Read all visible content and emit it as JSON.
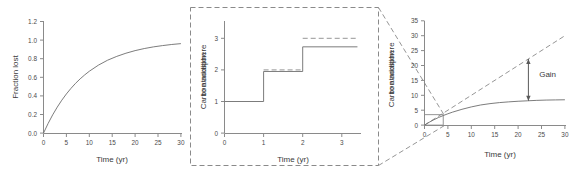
{
  "figure": {
    "panel_count": 3,
    "background": "#ffffff",
    "line_color": "#6d6d6d",
    "text_color": "#3a3a3a",
    "dashed_color": "#8a8a8a"
  },
  "chart_data": [
    {
      "id": "panel1",
      "type": "line",
      "title": "",
      "xlabel": "Time (yr)",
      "ylabel": "Fraction lost",
      "xlim": [
        0,
        31
      ],
      "ylim": [
        0,
        1.2
      ],
      "xticks": [
        0,
        5,
        10,
        15,
        20,
        25,
        30
      ],
      "xticklabels": [
        "0",
        "5",
        "10",
        "15",
        "20",
        "25",
        "30"
      ],
      "yticks": [
        0.0,
        0.2,
        0.4,
        0.6,
        0.8,
        1.0,
        1.2
      ],
      "yticklabels": [
        "0.0",
        "0.2",
        "0.4",
        "0.6",
        "0.8",
        "1.0",
        "1.2"
      ],
      "grid": false,
      "legend": null,
      "series": [
        {
          "name": "fraction lost",
          "style": "solid",
          "description": "saturating exponential 1-exp(-t/9.2)",
          "x": [
            0,
            1,
            2,
            3,
            4,
            5,
            6,
            7,
            8,
            9,
            10,
            12,
            14,
            16,
            18,
            20,
            22,
            24,
            26,
            28,
            30
          ],
          "y": [
            0.0,
            0.103,
            0.196,
            0.279,
            0.354,
            0.421,
            0.481,
            0.535,
            0.583,
            0.626,
            0.665,
            0.731,
            0.784,
            0.825,
            0.859,
            0.887,
            0.909,
            0.927,
            0.941,
            0.953,
            0.962
          ]
        }
      ]
    },
    {
      "id": "panel2",
      "type": "line",
      "title": "",
      "xlabel": "Time (yr)",
      "ylabel": "Carbon addition to atmosphere",
      "xlim": [
        0,
        3.5
      ],
      "ylim": [
        0,
        3.4
      ],
      "xticks": [
        0,
        1,
        2,
        3
      ],
      "xticklabels": [
        "0",
        "1",
        "2",
        "3"
      ],
      "yticks": [
        0,
        1,
        2,
        3
      ],
      "yticklabels": [
        "0",
        "1",
        "2",
        "3"
      ],
      "grid": false,
      "legend": null,
      "boxed": true,
      "series": [
        {
          "name": "cumulative addition (steps)",
          "style": "solid",
          "step_x": [
            0,
            1,
            1,
            2,
            2,
            3.4
          ],
          "step_y": [
            1,
            1,
            1.95,
            1.95,
            2.73,
            2.73
          ]
        },
        {
          "name": "ideal levels",
          "style": "dashed",
          "segments": [
            {
              "x": [
                1,
                2
              ],
              "y": [
                2,
                2
              ]
            },
            {
              "x": [
                2,
                3.4
              ],
              "y": [
                3,
                3
              ]
            }
          ]
        }
      ]
    },
    {
      "id": "panel3",
      "type": "line",
      "title": "",
      "xlabel": "Time (yr)",
      "ylabel": "Carbon addition to atmosphere",
      "xlim": [
        0,
        31
      ],
      "ylim": [
        0,
        35
      ],
      "xticks": [
        0,
        5,
        10,
        15,
        20,
        25,
        30
      ],
      "xticklabels": [
        "0",
        "5",
        "10",
        "15",
        "20",
        "25",
        "30"
      ],
      "yticks": [
        0,
        5,
        10,
        15,
        20,
        25,
        30,
        35
      ],
      "yticklabels": [
        "0",
        "5",
        "10",
        "15",
        "20",
        "25",
        "30",
        "35"
      ],
      "grid": false,
      "legend": null,
      "annotations": [
        {
          "name": "gain-label",
          "text": "Gain",
          "x": 24.5,
          "y": 16
        }
      ],
      "series": [
        {
          "name": "cumulative emission (no loss)",
          "style": "dashed",
          "x": [
            0,
            30
          ],
          "y": [
            0,
            30
          ]
        },
        {
          "name": "atmospheric carbon (with loss)",
          "style": "solid",
          "x": [
            0,
            1,
            2,
            3,
            4,
            5,
            6,
            8,
            10,
            12,
            14,
            16,
            18,
            20,
            22,
            24,
            26,
            28,
            30
          ],
          "y": [
            0.0,
            0.95,
            1.8,
            2.55,
            3.2,
            3.8,
            4.35,
            5.3,
            6.1,
            6.75,
            7.2,
            7.55,
            7.8,
            8.0,
            8.15,
            8.3,
            8.4,
            8.45,
            8.5
          ]
        },
        {
          "name": "gain arrow",
          "style": "double-arrow",
          "x": 22.2,
          "y_top": 22.2,
          "y_bottom": 8.15
        },
        {
          "name": "zoom source box",
          "style": "solid-thin-rect",
          "x0": 0,
          "y0": 0,
          "x1": 4.0,
          "y1": 3.5
        }
      ]
    }
  ],
  "connectors": {
    "name": "zoom-callout",
    "style": "dashed",
    "description": "dashed lines from the boxed middle panel corners to the small box in panel 3"
  }
}
